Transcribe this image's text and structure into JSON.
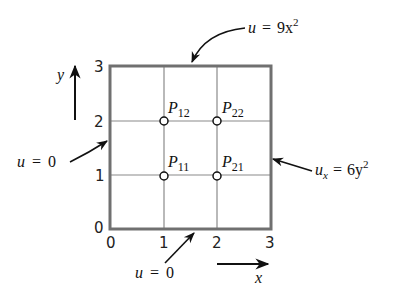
{
  "diagram": {
    "domain": {
      "x_range": [
        0,
        3
      ],
      "y_range": [
        0,
        3
      ]
    },
    "axes": {
      "x_label": "x",
      "y_label": "y",
      "x_ticks": [
        "0",
        "1",
        "2",
        "3"
      ],
      "y_ticks": [
        "0",
        "1",
        "2",
        "3"
      ]
    },
    "grid_spacing": 1,
    "nodes": [
      {
        "name": "P",
        "sub": "11",
        "x": 1,
        "y": 1
      },
      {
        "name": "P",
        "sub": "21",
        "x": 2,
        "y": 1
      },
      {
        "name": "P",
        "sub": "12",
        "x": 1,
        "y": 2
      },
      {
        "name": "P",
        "sub": "22",
        "x": 2,
        "y": 2
      }
    ],
    "boundary_conditions": {
      "top": {
        "lhs": "u",
        "eq": "=",
        "rhs": "9x",
        "sup": "2"
      },
      "right": {
        "lhs": "u",
        "lhs_sub": "x",
        "eq": "=",
        "rhs": "6y",
        "sup": "2"
      },
      "left": {
        "lhs": "u",
        "eq": "=",
        "rhs": "0"
      },
      "bottom": {
        "lhs": "u",
        "eq": "=",
        "rhs": "0"
      }
    },
    "colors": {
      "border": "#777777",
      "grid": "#888888",
      "ink": "#111111"
    }
  }
}
